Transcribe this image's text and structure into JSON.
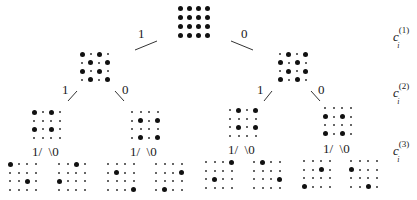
{
  "diagram": {
    "type": "binary-tree",
    "edge_labels": {
      "left": "1",
      "right": "0"
    },
    "level_labels": [
      {
        "base": "c",
        "sub": "i",
        "sup": "(1)"
      },
      {
        "base": "c",
        "sub": "i",
        "sup": "(2)"
      },
      {
        "base": "c",
        "sub": "i",
        "sup": "(3)"
      }
    ],
    "nodes": {
      "root": [
        [
          1,
          1,
          1,
          1
        ],
        [
          1,
          1,
          1,
          1
        ],
        [
          1,
          1,
          1,
          1
        ],
        [
          1,
          1,
          1,
          1
        ]
      ],
      "level2": [
        [
          [
            1,
            0,
            1,
            0
          ],
          [
            0,
            1,
            0,
            1
          ],
          [
            1,
            0,
            1,
            0
          ],
          [
            0,
            1,
            0,
            1
          ]
        ],
        [
          [
            0,
            1,
            0,
            1
          ],
          [
            1,
            0,
            1,
            0
          ],
          [
            0,
            1,
            0,
            1
          ],
          [
            1,
            0,
            1,
            0
          ]
        ]
      ],
      "level3": [
        [
          [
            1,
            0,
            1,
            0
          ],
          [
            0,
            0,
            0,
            0
          ],
          [
            1,
            0,
            1,
            0
          ],
          [
            0,
            0,
            0,
            0
          ]
        ],
        [
          [
            0,
            0,
            0,
            0
          ],
          [
            0,
            1,
            0,
            1
          ],
          [
            0,
            0,
            0,
            0
          ],
          [
            0,
            1,
            0,
            1
          ]
        ],
        [
          [
            0,
            1,
            0,
            1
          ],
          [
            0,
            0,
            0,
            0
          ],
          [
            0,
            1,
            0,
            1
          ],
          [
            0,
            0,
            0,
            0
          ]
        ],
        [
          [
            0,
            0,
            0,
            0
          ],
          [
            1,
            0,
            1,
            0
          ],
          [
            0,
            0,
            0,
            0
          ],
          [
            1,
            0,
            1,
            0
          ]
        ]
      ],
      "level4": [
        [
          [
            1,
            0,
            0,
            0
          ],
          [
            0,
            0,
            0,
            0
          ],
          [
            0,
            0,
            1,
            0
          ],
          [
            0,
            0,
            0,
            0
          ]
        ],
        [
          [
            0,
            0,
            1,
            0
          ],
          [
            0,
            0,
            0,
            0
          ],
          [
            1,
            0,
            0,
            0
          ],
          [
            0,
            0,
            0,
            0
          ]
        ],
        [
          [
            0,
            0,
            0,
            0
          ],
          [
            0,
            1,
            0,
            0
          ],
          [
            0,
            0,
            0,
            0
          ],
          [
            0,
            0,
            0,
            1
          ]
        ],
        [
          [
            0,
            0,
            0,
            0
          ],
          [
            0,
            0,
            0,
            1
          ],
          [
            0,
            0,
            0,
            0
          ],
          [
            0,
            1,
            0,
            0
          ]
        ],
        [
          [
            0,
            0,
            0,
            1
          ],
          [
            0,
            0,
            0,
            0
          ],
          [
            0,
            1,
            0,
            0
          ],
          [
            0,
            0,
            0,
            0
          ]
        ],
        [
          [
            0,
            1,
            0,
            0
          ],
          [
            0,
            0,
            0,
            0
          ],
          [
            0,
            0,
            0,
            1
          ],
          [
            0,
            0,
            0,
            0
          ]
        ],
        [
          [
            0,
            0,
            0,
            0
          ],
          [
            0,
            0,
            1,
            0
          ],
          [
            0,
            0,
            0,
            0
          ],
          [
            1,
            0,
            0,
            0
          ]
        ],
        [
          [
            0,
            0,
            0,
            0
          ],
          [
            1,
            0,
            0,
            0
          ],
          [
            0,
            0,
            0,
            0
          ],
          [
            0,
            0,
            1,
            0
          ]
        ]
      ]
    }
  }
}
